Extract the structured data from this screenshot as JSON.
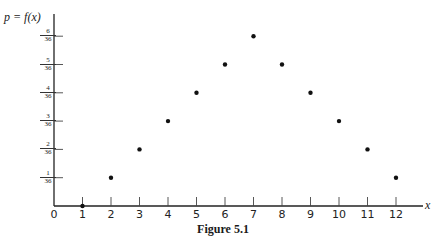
{
  "chart_data": {
    "type": "scatter",
    "title": "",
    "caption": "Figure 5.1",
    "xlabel": "x",
    "ylabel": "p = f(x)",
    "x_ticks": [
      "0",
      "1",
      "2",
      "3",
      "4",
      "5",
      "6",
      "7",
      "8",
      "9",
      "10",
      "11",
      "12"
    ],
    "y_ticks": [
      {
        "num": "1",
        "den": "36",
        "value": 1
      },
      {
        "num": "2",
        "den": "36",
        "value": 2
      },
      {
        "num": "3",
        "den": "36",
        "value": 3
      },
      {
        "num": "4",
        "den": "36",
        "value": 4
      },
      {
        "num": "5",
        "den": "36",
        "value": 5
      },
      {
        "num": "6",
        "den": "36",
        "value": 6
      }
    ],
    "x": [
      1,
      2,
      3,
      4,
      5,
      6,
      7,
      8,
      9,
      10,
      11,
      12
    ],
    "y_numerator_over_36": [
      0,
      1,
      2,
      3,
      4,
      5,
      6,
      5,
      4,
      3,
      2,
      1
    ],
    "y": [
      0,
      0.0278,
      0.0556,
      0.0833,
      0.1111,
      0.1389,
      0.1667,
      0.1389,
      0.1111,
      0.0833,
      0.0556,
      0.0278
    ],
    "xlim": [
      0,
      12.9
    ],
    "ylim": [
      0,
      0.1944
    ],
    "grid": false,
    "legend": null
  },
  "layout": {
    "origin_px": [
      54,
      206
    ],
    "x_unit_px": 28.5,
    "y_unit_px": 28.3
  }
}
